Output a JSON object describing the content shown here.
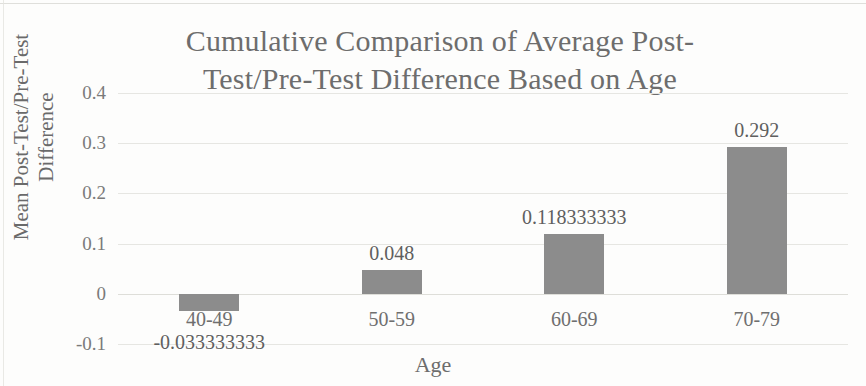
{
  "chart_data": {
    "type": "bar",
    "title_line1": "Cumulative Comparison of Average Post-",
    "title_line2": "Test/Pre-Test Difference Based on Age",
    "xlabel": "Age",
    "ylabel": "Mean Post-Test/Pre-Test Difference",
    "ylabel_line1": "Mean Post-Test/Pre-Test",
    "ylabel_line2": "Difference",
    "categories": [
      "40-49",
      "50-59",
      "60-69",
      "70-79"
    ],
    "values": [
      -0.033333333,
      0.048,
      0.118333333,
      0.292
    ],
    "value_labels": [
      "-0.033333333",
      "0.048",
      "0.118333333",
      "0.292"
    ],
    "ylim": [
      -0.1,
      0.4
    ],
    "yticks": [
      0.4,
      0.3,
      0.2,
      0.1,
      0,
      -0.1
    ],
    "ytick_labels": [
      "0.4",
      "0.3",
      "0.2",
      "0.1",
      "0",
      "-0.1"
    ],
    "grid": true,
    "legend": false,
    "bar_color": "#8c8c8c",
    "gridline_color": "#e6e6e2",
    "text_color": "#6d6d6d",
    "background": "#fdfdfc"
  }
}
